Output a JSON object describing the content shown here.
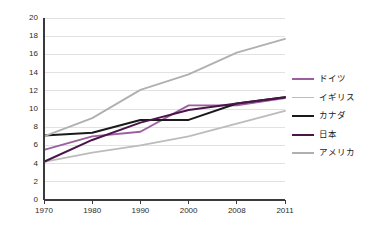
{
  "chart_data": {
    "type": "line",
    "title": "",
    "xlabel": "",
    "ylabel": "",
    "categories": [
      "1970",
      "1980",
      "1990",
      "2000",
      "2008",
      "2011"
    ],
    "ylim": [
      0,
      20
    ],
    "ytick_step": 2,
    "yticks": [
      "0",
      "2",
      "4",
      "6",
      "8",
      "10",
      "12",
      "14",
      "16",
      "18",
      "20"
    ],
    "grid": "horizontal",
    "legend_position": "right",
    "series": [
      {
        "name": "ドイツ",
        "color": "#9b5fa0",
        "values": [
          5.5,
          7.0,
          7.5,
          10.4,
          10.4,
          11.2
        ]
      },
      {
        "name": "イギリス",
        "color": "#bcbcbc",
        "values": [
          4.2,
          5.2,
          6.0,
          7.0,
          8.4,
          9.8
        ]
      },
      {
        "name": "カナダ",
        "color": "#1a1a1a",
        "values": [
          7.1,
          7.4,
          8.8,
          8.8,
          10.6,
          11.3
        ]
      },
      {
        "name": "日本",
        "color": "#4a1548",
        "values": [
          4.2,
          6.6,
          8.5,
          9.9,
          10.6,
          11.3
        ]
      },
      {
        "name": "アメリカ",
        "color": "#b0b0b0",
        "values": [
          7.0,
          9.0,
          12.1,
          13.8,
          16.2,
          17.7
        ]
      }
    ]
  },
  "colors": {
    "axis": "#3a3a3a",
    "grid": "#e2e2e2",
    "background": "#ffffff",
    "text": "#2b2b2b"
  }
}
